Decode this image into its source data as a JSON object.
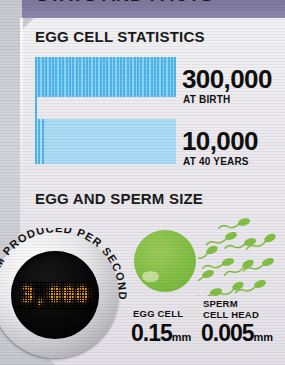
{
  "header": {
    "title": "STATS AND FACTS",
    "bar_color": "#7e789f"
  },
  "sections": {
    "stats": {
      "heading": "EGG CELL STATISTICS"
    },
    "size": {
      "heading": "EGG AND SPERM SIZE"
    }
  },
  "chart_data": {
    "type": "bar",
    "title": "EGG CELL STATISTICS",
    "orientation": "horizontal",
    "categories": [
      "AT BIRTH",
      "AT 40 YEARS"
    ],
    "values": [
      300000,
      10000
    ],
    "value_labels": [
      "300,000",
      "10,000"
    ],
    "xlabel": "",
    "ylabel": "",
    "grid": false,
    "legend": false,
    "note": "Both bars drawn at equal full width; the first bar is densely striped medium blue, the second is solid light blue with a narrow striped band at its left edge.",
    "series_colors": [
      "#4fb6ec",
      "#aadcf5"
    ]
  },
  "bars": [
    {
      "value_label": "300,000",
      "caption": "AT BIRTH",
      "color": "#4fb6ec",
      "style": "striped"
    },
    {
      "value_label": "10,000",
      "caption": "AT 40 YEARS",
      "color": "#aadcf5",
      "style": "solid"
    }
  ],
  "gauge": {
    "reading": "3,000",
    "caption": "SPERM PRODUCED PER SECOND",
    "display_color": "#f0a415",
    "face_color": "#000000"
  },
  "size_facts": [
    {
      "label": "EGG CELL",
      "label_line2": "",
      "value": "0.15",
      "unit": "mm",
      "art_color": "#83bf45"
    },
    {
      "label": "SPERM",
      "label_line2": "CELL HEAD",
      "value": "0.005",
      "unit": "mm",
      "art_color": "#83bf45"
    }
  ]
}
